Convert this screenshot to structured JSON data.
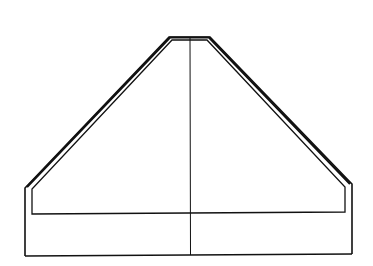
{
  "diagram": {
    "type": "line-drawing",
    "shape": "trapezoidal cross-section with inner outline and vertical centerline",
    "stroke_color": "#111111",
    "background": "#ffffff",
    "outer_outline": [
      [
        25,
        256
      ],
      [
        25,
        188
      ],
      [
        170,
        37
      ],
      [
        209,
        37
      ],
      [
        352,
        184
      ],
      [
        352,
        254
      ]
    ],
    "outer_bottom": [
      [
        25,
        256
      ],
      [
        352,
        254
      ]
    ],
    "inner_outline": [
      [
        32,
        214
      ],
      [
        32,
        188
      ],
      [
        172,
        39
      ],
      [
        207,
        39
      ],
      [
        345,
        186
      ],
      [
        345,
        212
      ],
      [
        32,
        214
      ]
    ],
    "centerline": [
      [
        190,
        38
      ],
      [
        190,
        255
      ]
    ]
  }
}
